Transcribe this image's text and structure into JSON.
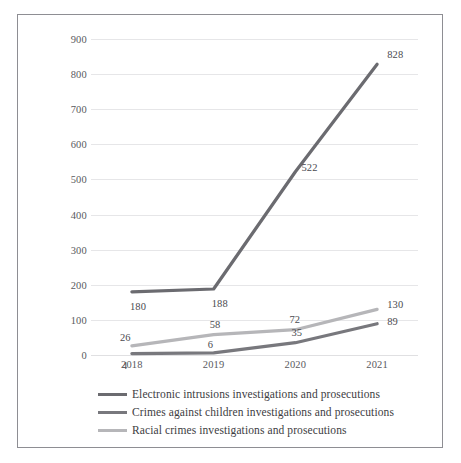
{
  "figure": {
    "cropped_heading_fragment": "",
    "frame_color": "#8e8e93"
  },
  "chart_data": {
    "type": "line",
    "title": "",
    "subtitle": "",
    "xlabel": "",
    "ylabel": "",
    "categories": [
      "2018",
      "2019",
      "2020",
      "2021"
    ],
    "ylim": [
      0,
      900
    ],
    "yticks": [
      0,
      100,
      200,
      300,
      400,
      500,
      600,
      700,
      800,
      900
    ],
    "ytick_labels": [
      "0",
      "100",
      "200",
      "300",
      "400",
      "500",
      "600",
      "700",
      "800",
      "900"
    ],
    "grid": true,
    "grid_axis": "y",
    "legend_position": "bottom",
    "data_labels": true,
    "series": [
      {
        "name": "Electronic intrusions investigations and prosecutions",
        "color": "#6b6b70",
        "values": [
          180,
          188,
          522,
          828
        ],
        "labels": [
          "180",
          "188",
          "522",
          "828"
        ]
      },
      {
        "name": "Crimes against children investigations and prosecutions",
        "color": "#78787d",
        "values": [
          4,
          6,
          35,
          89
        ],
        "labels": [
          "4",
          "6",
          "35",
          "89"
        ]
      },
      {
        "name": "Racial crimes investigations and prosecutions",
        "color": "#b6b6b9",
        "values": [
          26,
          58,
          72,
          130
        ],
        "labels": [
          "26",
          "58",
          "72",
          "130"
        ]
      }
    ]
  },
  "legend": {
    "items": [
      {
        "label": "Electronic intrusions investigations and prosecutions",
        "color": "#6b6b70"
      },
      {
        "label": "Crimes against children investigations and prosecutions",
        "color": "#78787d"
      },
      {
        "label": "Racial crimes investigations and prosecutions",
        "color": "#b6b6b9"
      }
    ]
  }
}
